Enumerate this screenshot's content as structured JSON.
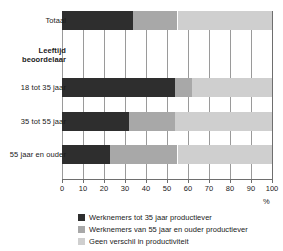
{
  "chart_data": {
    "type": "bar",
    "orientation": "horizontal",
    "stacked": true,
    "title": "",
    "xlabel": "%",
    "ylabel": "",
    "xlim": [
      0,
      100
    ],
    "xticks": [
      "0",
      "10",
      "20",
      "30",
      "40",
      "50",
      "60",
      "70",
      "80",
      "90",
      "100"
    ],
    "grid": true,
    "legend_position": "bottom",
    "categories": [
      "Totaal",
      "Leeftijd beoordelaar",
      "18 tot 35 jaar",
      "35 tot 55 jaar",
      "55 jaar en ouder"
    ],
    "series": [
      {
        "name": "Werknemers tot 35 jaar productiever",
        "color": "#2e2e2e",
        "values": [
          34,
          null,
          54,
          32,
          23
        ]
      },
      {
        "name": "Werknemers van 55 jaar en ouder productiever",
        "color": "#a8a8a8",
        "values": [
          21,
          null,
          8,
          22,
          32
        ]
      },
      {
        "name": "Geen verschil in productiviteit",
        "color": "#cfcfcf",
        "values": [
          45,
          null,
          38,
          46,
          45
        ]
      }
    ]
  },
  "axis": {
    "unit_label": "%"
  },
  "rows": [
    {
      "label": "Totaal",
      "is_header": false,
      "values": [
        34,
        21,
        45
      ]
    },
    {
      "label": "Leeftijd beoordelaar",
      "is_header": true,
      "values": []
    },
    {
      "label": "18 tot 35 jaar",
      "is_header": false,
      "values": [
        54,
        8,
        38
      ]
    },
    {
      "label": "35 tot 55 jaar",
      "is_header": false,
      "values": [
        32,
        22,
        46
      ]
    },
    {
      "label": "55 jaar en ouder",
      "is_header": false,
      "values": [
        23,
        32,
        45
      ]
    }
  ],
  "legend": [
    {
      "label": "Werknemers tot 35 jaar productiever",
      "color": "#2e2e2e"
    },
    {
      "label": "Werknemers van 55 jaar en ouder productiever",
      "color": "#a8a8a8"
    },
    {
      "label": "Geen verschil in productiviteit",
      "color": "#cfcfcf"
    }
  ]
}
